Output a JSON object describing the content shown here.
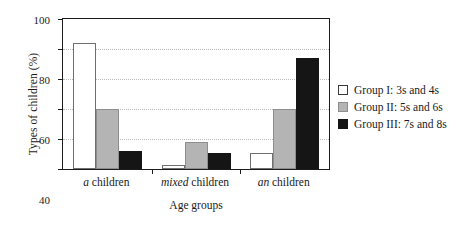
{
  "chart_data": {
    "type": "bar",
    "title": "",
    "xlabel": "Age groups",
    "ylabel": "Types of children (%)",
    "ylim": [
      0,
      100
    ],
    "yticks": [
      0,
      20,
      40,
      60,
      80,
      100
    ],
    "ytick_labels": [
      "0",
      "20",
      "40",
      "60",
      "80",
      "100"
    ],
    "grid": "horizontal-dotted",
    "legend_position": "right",
    "categories": [
      {
        "italic_word": "a",
        "rest": " children"
      },
      {
        "italic_word": "mixed",
        "rest": " children"
      },
      {
        "italic_word": "an",
        "rest": " children"
      }
    ],
    "category_labels": [
      "a children",
      "mixed children",
      "an children"
    ],
    "series": [
      {
        "name": "Group I: 3s and 4s",
        "color": "#ffffff",
        "values": [
          84,
          3,
          11
        ]
      },
      {
        "name": "Group II: 5s and 6s",
        "color": "#b4b4b4",
        "values": [
          40,
          18,
          40
        ]
      },
      {
        "name": "Group III: 7s and 8s",
        "color": "#151515",
        "values": [
          12,
          11,
          74
        ]
      }
    ]
  },
  "legend": {
    "items": [
      {
        "label": "Group I: 3s and 4s",
        "swatch": "g1"
      },
      {
        "label": "Group II: 5s and 6s",
        "swatch": "g2"
      },
      {
        "label": "Group III: 7s and 8s",
        "swatch": "g3"
      }
    ]
  },
  "axes": {
    "y_title": "Types of children (%)",
    "x_title": "Age groups"
  },
  "colors": {
    "group1": "#ffffff",
    "group2": "#b4b4b4",
    "group3": "#151515",
    "frame": "#1c1c1c",
    "gridline": "#b9b9b9"
  }
}
